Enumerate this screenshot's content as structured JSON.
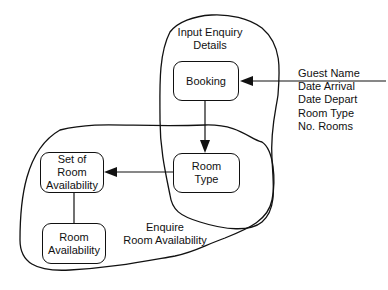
{
  "diagram": {
    "regions": [
      {
        "id": "input-enquiry-details",
        "label_lines": [
          "Input Enquiry",
          "Details"
        ]
      },
      {
        "id": "enquire-room-availability",
        "label_lines": [
          "Enquire",
          "Room Availability"
        ]
      }
    ],
    "nodes": [
      {
        "id": "booking",
        "label_lines": [
          "Booking"
        ]
      },
      {
        "id": "room-type",
        "label_lines": [
          "Room",
          "Type"
        ]
      },
      {
        "id": "set-of-room-availability",
        "label_lines": [
          "Set of",
          "Room",
          "Availability"
        ]
      },
      {
        "id": "room-availability",
        "label_lines": [
          "Room",
          "Availability"
        ]
      }
    ],
    "input_attributes": [
      "Guest Name",
      "Date Arrival",
      "Date Depart",
      "Room Type",
      "No. Rooms"
    ],
    "edges": [
      {
        "from": "input-attributes",
        "to": "booking",
        "type": "arrow"
      },
      {
        "from": "booking",
        "to": "room-type",
        "type": "arrow"
      },
      {
        "from": "room-type",
        "to": "set-of-room-availability",
        "type": "arrow"
      },
      {
        "from": "set-of-room-availability",
        "to": "room-availability",
        "type": "line"
      }
    ]
  }
}
